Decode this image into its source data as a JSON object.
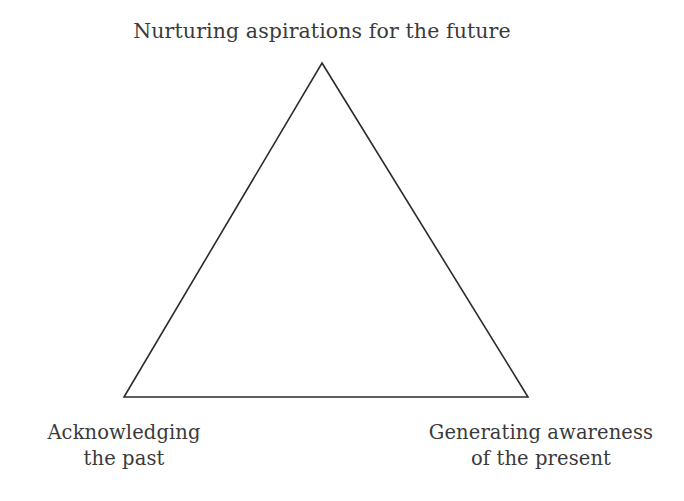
{
  "canvas": {
    "width": 684,
    "height": 501,
    "background_color": "#ffffff"
  },
  "diagram": {
    "type": "triangle",
    "shape_name": "triangle-outline",
    "stroke_color": "#2b2b2b",
    "stroke_width": 1.6,
    "fill": "none",
    "vertices": {
      "apex": {
        "x": 322,
        "y": 63
      },
      "bottom_left": {
        "x": 124,
        "y": 397
      },
      "bottom_right": {
        "x": 528,
        "y": 397
      }
    }
  },
  "labels": {
    "text_color": "#3a3a3a",
    "apex": {
      "text": "Nurturing aspirations for the future",
      "position": "top"
    },
    "bottom_left": {
      "text": "Acknowledging\nthe past",
      "position": "bottom-left"
    },
    "bottom_right": {
      "text": "Generating awareness\nof the present",
      "position": "bottom-right"
    }
  }
}
